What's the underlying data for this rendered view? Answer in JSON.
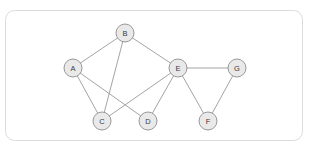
{
  "panel": {
    "name": "graph-panel",
    "frame": {
      "x": 5.5,
      "y": 10.5,
      "width": 297,
      "height": 130,
      "rx": 9
    },
    "background_color": "#ffffff",
    "border_color": "#dcdcdc"
  },
  "chart_data": {
    "type": "diagram",
    "subtype": "undirected-node-link-graph",
    "title": "",
    "xlabel": "",
    "ylabel": "",
    "grid": false,
    "legend": null,
    "node_radius": 9,
    "node_fill": "#e9e9e9",
    "node_stroke": "#8d8d8d",
    "edge_stroke": "#9a9a9a",
    "nodes": [
      {
        "id": "A",
        "label": "A",
        "x": 73,
        "y": 68
      },
      {
        "id": "B",
        "label": "B",
        "x": 125,
        "y": 33
      },
      {
        "id": "C",
        "label": "C",
        "x": 102,
        "y": 121
      },
      {
        "id": "D",
        "label": "D",
        "x": 148,
        "y": 121
      },
      {
        "id": "E",
        "label": "E",
        "x": 178,
        "y": 68
      },
      {
        "id": "F",
        "label": "F",
        "x": 208,
        "y": 121
      },
      {
        "id": "G",
        "label": "G",
        "x": 237,
        "y": 68
      }
    ],
    "edges": [
      {
        "source": "A",
        "target": "B"
      },
      {
        "source": "A",
        "target": "C"
      },
      {
        "source": "A",
        "target": "D"
      },
      {
        "source": "B",
        "target": "C"
      },
      {
        "source": "B",
        "target": "E"
      },
      {
        "source": "C",
        "target": "E"
      },
      {
        "source": "D",
        "target": "E"
      },
      {
        "source": "E",
        "target": "F"
      },
      {
        "source": "E",
        "target": "G"
      },
      {
        "source": "F",
        "target": "G"
      }
    ],
    "node_count": 7,
    "edge_count": 10
  }
}
